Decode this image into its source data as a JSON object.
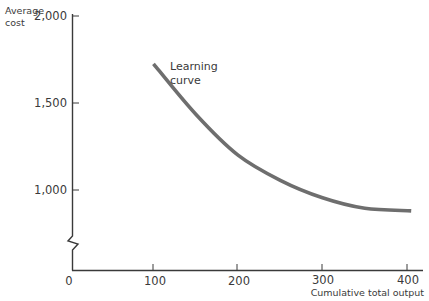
{
  "chart_data": {
    "type": "line",
    "title": "",
    "xlabel": "Cumulative total output",
    "ylabel": "Average cost",
    "x_ticks": [
      0,
      100,
      200,
      300,
      400
    ],
    "x_tick_labels": [
      "0",
      "100",
      "200",
      "300",
      "400"
    ],
    "y_ticks": [
      1000,
      1500,
      2000
    ],
    "y_tick_labels": [
      "1,000",
      "1,500",
      "2,000"
    ],
    "xlim": [
      0,
      420
    ],
    "ylim": [
      540,
      2000
    ],
    "y_axis_break": true,
    "grid": false,
    "legend": null,
    "annotations": [
      {
        "text": "Learning curve",
        "x": 120,
        "y": 1650
      }
    ],
    "series": [
      {
        "name": "Learning curve",
        "color": "#6e6e6e",
        "x": [
          100,
          150,
          200,
          250,
          300,
          350,
          405
        ],
        "y": [
          1725,
          1435,
          1200,
          1055,
          955,
          895,
          880
        ]
      }
    ]
  },
  "labels": {
    "ylabel_line1": "Average",
    "ylabel_line2": "cost",
    "xlabel": "Cumulative total output",
    "annotation_line1": "Learning",
    "annotation_line2": "curve",
    "x0": "0",
    "x100": "100",
    "x200": "200",
    "x300": "300",
    "x400": "400",
    "y1000": "1,000",
    "y1500": "1,500",
    "y2000": "2,000"
  }
}
